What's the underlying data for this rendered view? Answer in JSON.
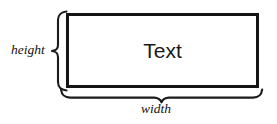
{
  "diagram": {
    "canvas": {
      "width": 277,
      "height": 124,
      "background": "#ffffff"
    },
    "box": {
      "label": "Text",
      "border_color": "#151515",
      "fill_color": "#ffffff",
      "border_width_px": 3,
      "x": 66,
      "y": 13,
      "width": 193,
      "height": 75
    },
    "annotations": {
      "height": {
        "label": "height",
        "orientation": "vertical",
        "brace_side": "left",
        "icon": "curly-brace-left-icon"
      },
      "width": {
        "label": "width",
        "orientation": "horizontal",
        "brace_side": "bottom",
        "icon": "curly-brace-bottom-icon"
      }
    },
    "stroke_color": "#1b1b1b"
  }
}
